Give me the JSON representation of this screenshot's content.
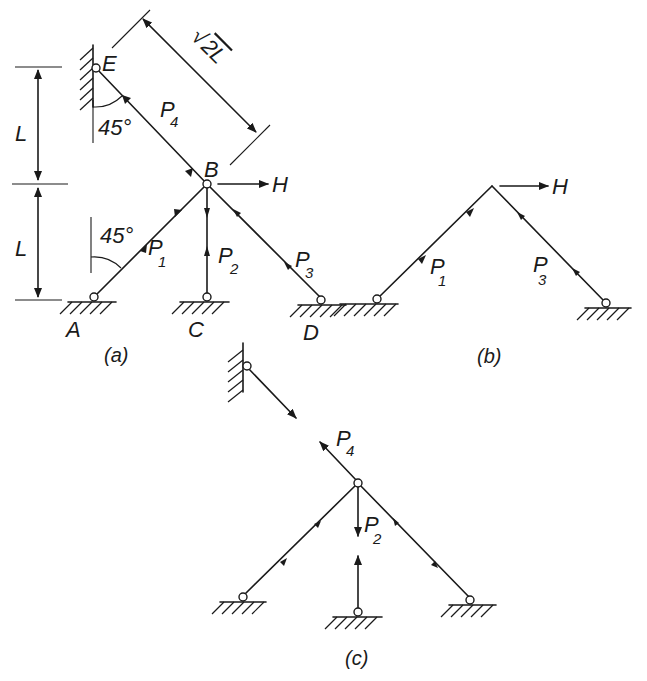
{
  "figure": {
    "panels": [
      {
        "id": "a",
        "caption": "(a)",
        "nodes": {
          "E": "E",
          "B": "B",
          "A": "A",
          "C": "C",
          "D": "D"
        },
        "bars": [
          "P1",
          "P2",
          "P3",
          "P4"
        ],
        "angle_upper": "45°",
        "angle_lower": "45°",
        "dim_upper": "L",
        "dim_lower": "L",
        "dim_diag": "√2L",
        "load": "H"
      },
      {
        "id": "b",
        "caption": "(b)",
        "bars": [
          "P1",
          "P3"
        ],
        "load": "H"
      },
      {
        "id": "c",
        "caption": "(c)",
        "bars": [
          "P4",
          "P2"
        ]
      }
    ]
  },
  "labels": {
    "E": "E",
    "B": "B",
    "A": "A",
    "C": "C",
    "D": "D",
    "H": "H",
    "P": "P",
    "sub1": "1",
    "sub2": "2",
    "sub3": "3",
    "sub4": "4",
    "angle": "45°",
    "L": "L",
    "sqrt": "√",
    "twoL": "2L",
    "cap_a": "(a)",
    "cap_b": "(b)",
    "cap_c": "(c)"
  }
}
